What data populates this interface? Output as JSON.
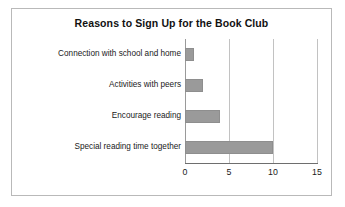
{
  "chart_data": {
    "type": "bar",
    "orientation": "horizontal",
    "title": "Reasons to Sign Up for the Book Club",
    "xlabel": "",
    "ylabel": "",
    "xlim": [
      0,
      15
    ],
    "xticks": [
      0,
      5,
      10,
      15
    ],
    "xtick_labels": [
      "0",
      "5",
      "10",
      "15"
    ],
    "grid": true,
    "grid_axis": "x",
    "legend": false,
    "categories": [
      "Connection with school and home",
      "Activities with peers",
      "Encourage reading",
      "Special reading time together"
    ],
    "values": [
      1,
      2,
      4,
      10
    ],
    "series": [
      {
        "name": "Responses",
        "values": [
          1,
          2,
          4,
          10
        ]
      }
    ],
    "colors": {
      "bar_fill": "#9a9a9a",
      "bar_border": "#8e8e8e",
      "gridline": "#c2c2c2",
      "axis": "#6e6e6e",
      "frame": "#b9b9b9",
      "text": "#1a1a1a",
      "title_text": "#111111",
      "background": "#ffffff"
    }
  }
}
